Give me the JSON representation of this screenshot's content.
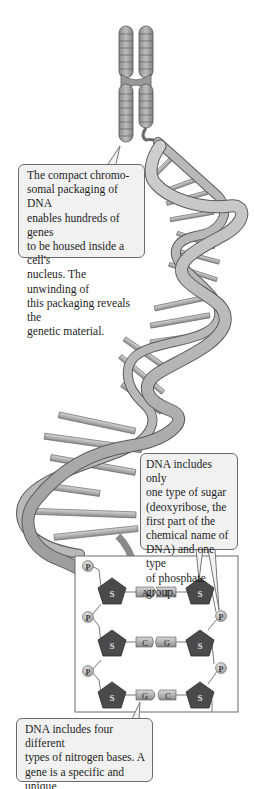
{
  "figure": {
    "callouts": {
      "chromosome": "The compact chromo-\nsomal packaging of DNA\nenables hundreds of genes\nto be housed inside a cell's\nnucleus. The unwinding of\nthis packaging reveals the\ngenetic material.",
      "sugar": "DNA includes only\none type of sugar\n(deoxyribose, the\nfirst part of the\nchemical name of\nDNA) and one type\nof phosphate group.",
      "bases": "DNA includes four different\ntypes of nitrogen bases. A\ngene is a specific and unique\nsequence of these bases."
    },
    "structure": {
      "sugar_label": "S",
      "phosphate_label": "P",
      "base_pairs": [
        {
          "left": "A",
          "right": "T"
        },
        {
          "left": "C",
          "right": "G"
        },
        {
          "left": "G",
          "right": "C"
        }
      ]
    },
    "colors": {
      "sugar_fill": "#4a4a4a",
      "phosphate_fill": "#bdbdbd",
      "base_fill": "#a8a8a8",
      "ribbon_fill": "#b4b4b4",
      "ribbon_stroke": "#5a5a5a",
      "callout_bg": "#f1f1f1"
    }
  }
}
